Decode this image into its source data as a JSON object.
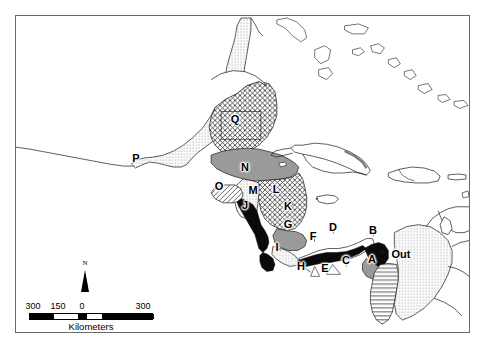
{
  "figure": {
    "type": "thematic-distribution-map",
    "region": "Central America, southern Mexico, Caribbean and northwestern South America"
  },
  "frame": {
    "border_color": "#6a6a6a",
    "background_color": "#ffffff"
  },
  "map_labels": [
    {
      "id": "A",
      "text": "A",
      "x": 371,
      "y": 258
    },
    {
      "id": "B",
      "text": "B",
      "x": 372,
      "y": 229
    },
    {
      "id": "C",
      "text": "C",
      "x": 345,
      "y": 259
    },
    {
      "id": "D",
      "text": "D",
      "x": 332,
      "y": 226
    },
    {
      "id": "E",
      "text": "E",
      "x": 324,
      "y": 267
    },
    {
      "id": "F",
      "text": "F",
      "x": 312,
      "y": 235
    },
    {
      "id": "G",
      "text": "G",
      "x": 287,
      "y": 223
    },
    {
      "id": "H",
      "text": "H",
      "x": 300,
      "y": 265
    },
    {
      "id": "I",
      "text": "I",
      "x": 276,
      "y": 246
    },
    {
      "id": "J",
      "text": "J",
      "x": 244,
      "y": 204
    },
    {
      "id": "K",
      "text": "K",
      "x": 287,
      "y": 205
    },
    {
      "id": "L",
      "text": "L",
      "x": 275,
      "y": 188
    },
    {
      "id": "M",
      "text": "M",
      "x": 252,
      "y": 189
    },
    {
      "id": "N",
      "text": "N",
      "x": 244,
      "y": 166
    },
    {
      "id": "O",
      "text": "O",
      "x": 218,
      "y": 185
    },
    {
      "id": "P",
      "text": "P",
      "x": 135,
      "y": 157
    },
    {
      "id": "Q",
      "text": "Q",
      "x": 234,
      "y": 118
    },
    {
      "id": "Out",
      "text": "Out",
      "x": 400,
      "y": 253
    }
  ],
  "north_arrow": {
    "label": "N"
  },
  "scale_bar": {
    "caption": "Kilometers",
    "ticks": [
      "300",
      "150",
      "0",
      "300"
    ],
    "tick_positions_pct": [
      0,
      20,
      40,
      100
    ]
  },
  "legend_patterns": {
    "stipple_dots": "outside / background distribution",
    "crosshatch": "cross-hatched range",
    "solid_gray": "gray filled range",
    "solid_black": "black filled range",
    "horizontal_lines": "line-hatched range",
    "white": "no data"
  }
}
